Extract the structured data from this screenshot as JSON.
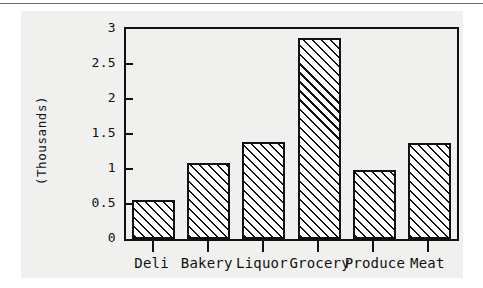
{
  "chart_data": {
    "type": "bar",
    "title": "",
    "subtitle": "",
    "xlabel": "",
    "ylabel": "(Thousands)",
    "categories": [
      "Deli",
      "Bakery",
      "Liquor",
      "Grocery",
      "Produce",
      "Meat"
    ],
    "values": [
      0.56,
      1.08,
      1.39,
      2.87,
      0.98,
      1.37
    ],
    "ylim": [
      0,
      3
    ],
    "ytick_labels": [
      "0",
      "0.5",
      "1",
      "1.5",
      "2",
      "2.5",
      "3"
    ],
    "ytick_values": [
      0,
      0.5,
      1,
      1.5,
      2,
      2.5,
      3
    ],
    "grid": false,
    "legend": null,
    "bar_fill": "diagonal-hatch",
    "bar_outline_color": "#111111",
    "axis_color": "#111111",
    "plot_background": "#f0f0ef",
    "page_background": "#f0f0ef"
  }
}
